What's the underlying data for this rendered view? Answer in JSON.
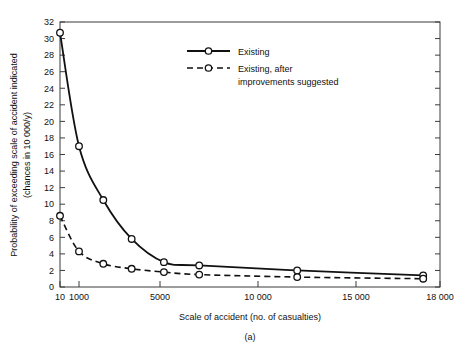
{
  "chart_data": {
    "type": "line",
    "title": "",
    "caption": "(a)",
    "xlabel": "Scale of accident (no. of casualties)",
    "ylabel_line1": "Probability of exceeding scale of accident indicated",
    "ylabel_line2": "(chances in 10 000/y)",
    "ylim": [
      0,
      32
    ],
    "ytick_labels": [
      "0",
      "2",
      "4",
      "6",
      "8",
      "10",
      "12",
      "14",
      "16",
      "18",
      "20",
      "22",
      "24",
      "26",
      "28",
      "30",
      "32"
    ],
    "ytick_values": [
      0,
      2,
      4,
      6,
      8,
      10,
      12,
      14,
      16,
      18,
      20,
      22,
      24,
      26,
      28,
      30,
      32
    ],
    "xtick_labels": [
      "10",
      "1000",
      "5000",
      "10 000",
      "15 000",
      "18 000"
    ],
    "xtick_values": [
      10,
      1000,
      5000,
      10000,
      15000,
      18000
    ],
    "x_axis_note": "non-linear (compressed below 1000)",
    "grid": false,
    "legend_position": "upper-right-inside",
    "series": [
      {
        "name": "Existing",
        "style": "solid",
        "marker": "open-circle",
        "x": [
          10,
          1000,
          2200,
          3600,
          5200,
          7000,
          12000,
          17400
        ],
        "values": [
          30.7,
          17.0,
          10.5,
          5.8,
          3.0,
          2.6,
          2.0,
          1.4
        ]
      },
      {
        "name": "Existing, after improvements suggested",
        "style": "dashed",
        "marker": "open-circle",
        "x": [
          10,
          1000,
          2200,
          3600,
          5200,
          7000,
          12000,
          17400
        ],
        "values": [
          8.6,
          4.3,
          2.8,
          2.2,
          1.8,
          1.5,
          1.2,
          1.0
        ]
      }
    ]
  },
  "legend": {
    "entries": [
      {
        "label": "Existing"
      },
      {
        "label_line1": "Existing, after",
        "label_line2": "improvements suggested"
      }
    ]
  }
}
